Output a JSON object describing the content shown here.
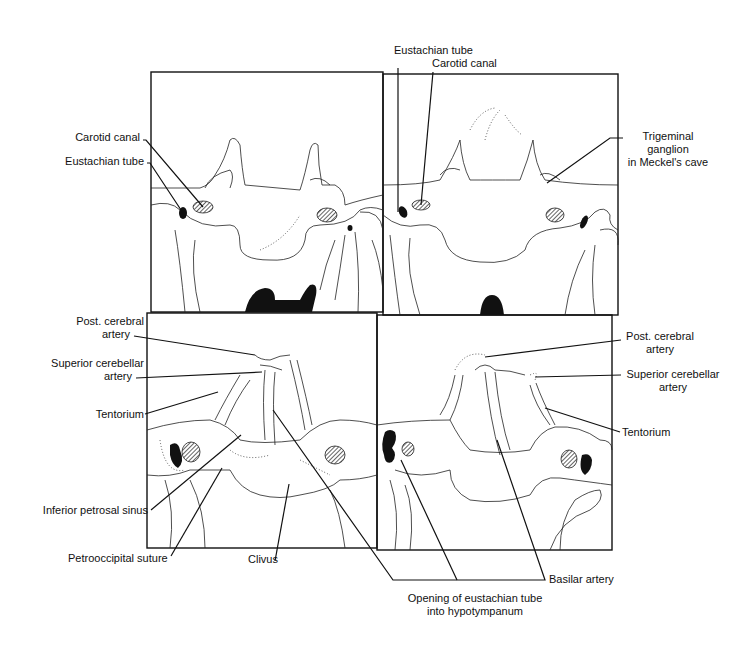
{
  "figure": {
    "panels": [
      {
        "id": "top-left",
        "labels": [
          "Carotid canal",
          "Eustachian tube"
        ]
      },
      {
        "id": "top-right",
        "labels": [
          "Eustachian tube",
          "Carotid canal",
          "Trigeminal ganglion in Meckel's cave"
        ]
      },
      {
        "id": "bottom-left",
        "labels": [
          "Post. cerebral artery",
          "Superior cerebellar artery",
          "Tentorium",
          "Inferior petrosal sinus",
          "Petrooccipital suture",
          "Clivus"
        ]
      },
      {
        "id": "bottom-right",
        "labels": [
          "Post. cerebral artery",
          "Superior cerebellar artery",
          "Tentorium",
          "Basilar artery",
          "Opening of eustachian tube into hypotympanum"
        ]
      }
    ]
  },
  "labels": {
    "tl_carotid": "Carotid canal",
    "tl_eustachian": "Eustachian tube",
    "tr_eustachian": "Eustachian tube",
    "tr_carotid": "Carotid canal",
    "tr_trigeminal_1": "Trigeminal",
    "tr_trigeminal_2": "ganglion",
    "tr_trigeminal_3": "in Meckel's cave",
    "bl_postcereb_1": "Post. cerebral",
    "bl_postcereb_2": "artery",
    "bl_supcereb_1": "Superior cerebellar",
    "bl_supcereb_2": "artery",
    "bl_tentorium": "Tentorium",
    "bl_infpetrosal": "Inferior petrosal sinus",
    "bl_petrooccipital": "Petrooccipital suture",
    "bl_clivus": "Clivus",
    "br_postcereb_1": "Post. cerebral",
    "br_postcereb_2": "artery",
    "br_supcereb_1": "Superior cerebellar",
    "br_supcereb_2": "artery",
    "br_tentorium": "Tentorium",
    "br_basilar": "Basilar artery",
    "br_opening_1": "Opening of eustachian tube",
    "br_opening_2": "into hypotympanum"
  }
}
